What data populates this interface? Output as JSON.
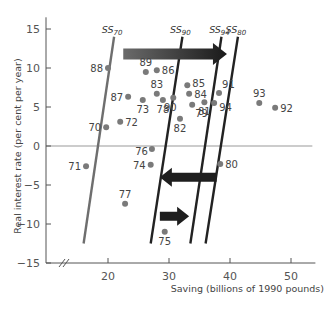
{
  "chart_data": {
    "type": "scatter",
    "title": "",
    "xlabel": "Saving (billions of 1990 pounds)",
    "ylabel": "Real interest rate (per cent per year)",
    "xlim": [
      13,
      54
    ],
    "ylim": [
      -15,
      16
    ],
    "x_ticks": [
      20,
      30,
      40,
      50
    ],
    "y_ticks": [
      -15,
      -10,
      -5,
      0,
      5,
      10,
      15
    ],
    "x_axis_break": true,
    "grid": false,
    "zero_line": true,
    "points": [
      {
        "label": "70",
        "x": 19.7,
        "y": 2.4
      },
      {
        "label": "71",
        "x": 16.4,
        "y": -2.6
      },
      {
        "label": "72",
        "x": 22.0,
        "y": 3.1
      },
      {
        "label": "73",
        "x": 25.7,
        "y": 5.9
      },
      {
        "label": "74",
        "x": 27.0,
        "y": -2.4
      },
      {
        "label": "75",
        "x": 29.3,
        "y": -11.0
      },
      {
        "label": "76",
        "x": 27.2,
        "y": -0.4
      },
      {
        "label": "77",
        "x": 22.8,
        "y": -7.4
      },
      {
        "label": "78",
        "x": 29.0,
        "y": 5.9
      },
      {
        "label": "79",
        "x": 33.8,
        "y": 5.3
      },
      {
        "label": "80",
        "x": 38.4,
        "y": -2.3
      },
      {
        "label": "81",
        "x": 35.8,
        "y": 5.6
      },
      {
        "label": "82",
        "x": 31.8,
        "y": 3.5
      },
      {
        "label": "83",
        "x": 28.0,
        "y": 6.7
      },
      {
        "label": "84",
        "x": 33.3,
        "y": 6.7
      },
      {
        "label": "85",
        "x": 33.0,
        "y": 7.8
      },
      {
        "label": "86",
        "x": 28.0,
        "y": 9.7
      },
      {
        "label": "87",
        "x": 23.3,
        "y": 6.3
      },
      {
        "label": "88",
        "x": 20.0,
        "y": 10.0
      },
      {
        "label": "89",
        "x": 26.2,
        "y": 9.5
      },
      {
        "label": "90",
        "x": 30.7,
        "y": 6.2
      },
      {
        "label": "91",
        "x": 38.2,
        "y": 6.8
      },
      {
        "label": "92",
        "x": 47.4,
        "y": 4.9
      },
      {
        "label": "93",
        "x": 44.8,
        "y": 5.5
      },
      {
        "label": "94",
        "x": 37.4,
        "y": 5.5
      }
    ],
    "supply_curves": [
      {
        "name": "SS70",
        "base": "SS",
        "sub": "70",
        "x_top": 21.0,
        "y_top": 14.0,
        "x_bottom": 16.0,
        "y_bottom": -12.5,
        "color": "#6e6e6e"
      },
      {
        "name": "SS90",
        "base": "SS",
        "sub": "90",
        "x_top": 32.2,
        "y_top": 14.0,
        "x_bottom": 27.0,
        "y_bottom": -12.5,
        "color": "#222222"
      },
      {
        "name": "SS94",
        "base": "SS",
        "sub": "94",
        "x_top": 38.6,
        "y_top": 14.0,
        "x_bottom": 33.5,
        "y_bottom": -12.5,
        "color": "#222222"
      },
      {
        "name": "SS80",
        "base": "SS",
        "sub": "80",
        "x_top": 41.3,
        "y_top": 14.0,
        "x_bottom": 36.0,
        "y_bottom": -12.5,
        "color": "#222222"
      }
    ],
    "arrows": [
      {
        "direction": "right",
        "x_from": 22.5,
        "x_to": 39.5,
        "y": 11.8,
        "style": "gradient-grey-to-black"
      },
      {
        "direction": "left",
        "x_from": 37.8,
        "x_to": 28.5,
        "y": -4.0,
        "style": "solid-black"
      },
      {
        "direction": "right",
        "x_from": 28.5,
        "x_to": 33.3,
        "y": -9.0,
        "style": "solid-black"
      }
    ]
  }
}
